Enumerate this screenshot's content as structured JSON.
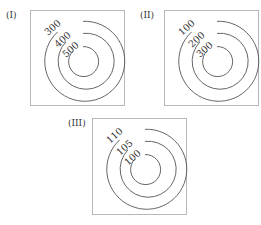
{
  "figure": {
    "panels": [
      {
        "label": "(I)",
        "contours": [
          {
            "value": "300",
            "r": 40
          },
          {
            "value": "400",
            "r": 28
          },
          {
            "value": "500",
            "r": 15
          }
        ]
      },
      {
        "label": "(II)",
        "contours": [
          {
            "value": "100",
            "r": 40
          },
          {
            "value": "200",
            "r": 28
          },
          {
            "value": "300",
            "r": 15
          }
        ]
      },
      {
        "label": "(III)",
        "contours": [
          {
            "value": "110",
            "r": 40
          },
          {
            "value": "105",
            "r": 28
          },
          {
            "value": "100",
            "r": 15
          }
        ]
      }
    ]
  }
}
